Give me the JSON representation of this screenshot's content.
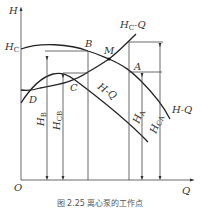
{
  "diagram": {
    "axes": {
      "y_label": "H",
      "x_label": "Q",
      "origin_label": "O"
    },
    "curves": {
      "hc_curve_label_main": "H",
      "hc_curve_label_sub": "C",
      "hc_curve_label_suffix": "-Q",
      "pump_curve_left_label": "H-Q",
      "pump_curve_right_label": "H-Q",
      "hc_intercept_main": "H",
      "hc_intercept_sub": "C"
    },
    "points": {
      "A": "A",
      "B": "B",
      "C": "C",
      "D": "D",
      "M": "M"
    },
    "dimensions": {
      "hb_main": "H",
      "hb_sub": "B",
      "hcb_main": "H",
      "hcb_sub": "CB",
      "ha_main": "H",
      "ha_sub": "A",
      "hca_main": "H",
      "hca_sub": "CA"
    },
    "caption": "图 2.25  离心泵的工作点"
  }
}
